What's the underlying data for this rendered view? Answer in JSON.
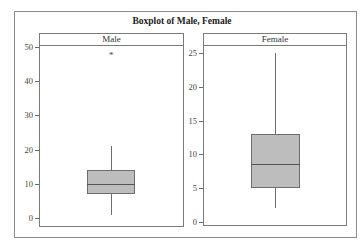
{
  "chart_data": {
    "type": "boxplot",
    "title": "Boxplot of Male, Female",
    "panels": [
      {
        "name": "Male",
        "ylim": [
          0,
          50
        ],
        "yticks": [
          0,
          10,
          20,
          30,
          40,
          50
        ],
        "whisker_low": 1,
        "q1": 7,
        "median": 10,
        "q3": 14,
        "whisker_high": 21,
        "outliers": [
          48
        ]
      },
      {
        "name": "Female",
        "ylim": [
          0,
          25
        ],
        "yticks": [
          0,
          5,
          10,
          15,
          20,
          25
        ],
        "whisker_low": 2,
        "q1": 5,
        "median": 8.6,
        "q3": 13,
        "whisker_high": 25,
        "outliers": []
      }
    ],
    "colors": {
      "box_fill": "#bdbdbd",
      "box_border": "#6e6e6e",
      "median": "#555555"
    },
    "grid": false,
    "legend": null
  },
  "title": "Boxplot of Male, Female",
  "male": {
    "label": "Male",
    "ticks": [
      "0",
      "10",
      "20",
      "30",
      "40",
      "50"
    ],
    "outlier_symbol": "*"
  },
  "female": {
    "label": "Female",
    "ticks": [
      "0",
      "5",
      "10",
      "15",
      "20",
      "25"
    ]
  }
}
